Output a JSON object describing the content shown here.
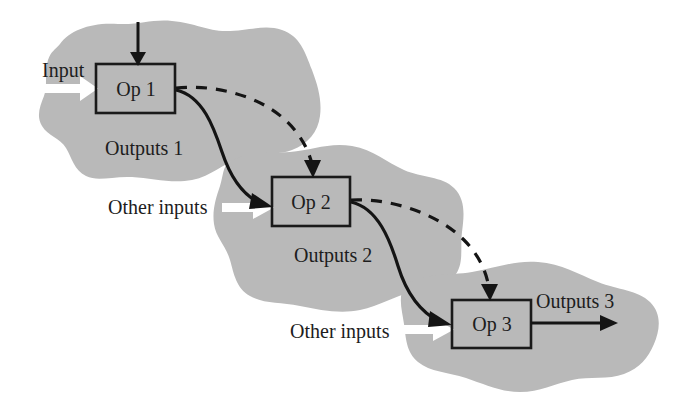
{
  "figure": {
    "type": "process-flow-diagram",
    "background_color": "#ffffff",
    "region_fill_color": "#b9b9b9",
    "line_color": "#141414",
    "external_input_arrow_color": "#ffffff"
  },
  "nodes": [
    {
      "id": "op1",
      "label": "Op 1",
      "x": 96,
      "y": 64,
      "w": 79,
      "h": 49
    },
    {
      "id": "op2",
      "label": "Op 2",
      "x": 272,
      "y": 177,
      "w": 78,
      "h": 49
    },
    {
      "id": "op3",
      "label": "Op 3",
      "x": 452,
      "y": 300,
      "w": 79,
      "h": 48
    }
  ],
  "labels": {
    "input": "Input",
    "outputs_1": "Outputs 1",
    "outputs_2": "Outputs 2",
    "outputs_3": "Outputs 3",
    "other_inputs_1": "Other inputs",
    "other_inputs_2": "Other inputs"
  },
  "connections": [
    {
      "id": "top-into-op1",
      "style": "solid",
      "from": "external-top",
      "to": "op1"
    },
    {
      "id": "op1-to-op2-solid",
      "style": "solid",
      "from": "op1",
      "to": "op2"
    },
    {
      "id": "op1-to-op2-dashed",
      "style": "dashed",
      "from": "op1",
      "to": "op2"
    },
    {
      "id": "op2-to-op3-solid",
      "style": "solid",
      "from": "op2",
      "to": "op3"
    },
    {
      "id": "op2-to-op3-dashed",
      "style": "dashed",
      "from": "op2",
      "to": "op3"
    },
    {
      "id": "op3-to-outputs3",
      "style": "solid",
      "from": "op3",
      "to": "external-right"
    },
    {
      "id": "input-into-op1",
      "style": "white-block",
      "from": "input",
      "to": "op1"
    },
    {
      "id": "other-inputs-into-op2",
      "style": "white-block",
      "from": "other_inputs_1",
      "to": "op2"
    },
    {
      "id": "other-inputs-into-op3",
      "style": "white-block",
      "from": "other_inputs_2",
      "to": "op3"
    }
  ]
}
